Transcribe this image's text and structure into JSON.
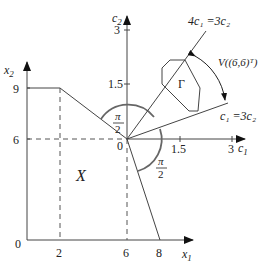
{
  "x_axes": {
    "x1_label": "x",
    "x1_sub": "1",
    "x2_label": "x",
    "x2_sub": "2",
    "origin_label": "0",
    "x1_ticks": [
      "2",
      "6",
      "8"
    ],
    "x2_ticks": [
      "6",
      "9"
    ]
  },
  "c_axes": {
    "c1_label": "c",
    "c1_sub": "1",
    "c2_label": "c",
    "c2_sub": "2",
    "origin_label": "0",
    "c1_ticks": [
      "1.5",
      "3"
    ],
    "c2_ticks": [
      "1.5",
      "3"
    ]
  },
  "region": {
    "label": "X"
  },
  "cone": {
    "gamma_label": "Γ",
    "upper_ray_label": "4c₁ =3c₂",
    "lower_ray_label": "c₁ =3c₂",
    "cone_label": "V((6,6)ᵀ)"
  },
  "angles": {
    "upper_num": "π",
    "upper_den": "2",
    "lower_num": "π",
    "lower_den": "2"
  }
}
